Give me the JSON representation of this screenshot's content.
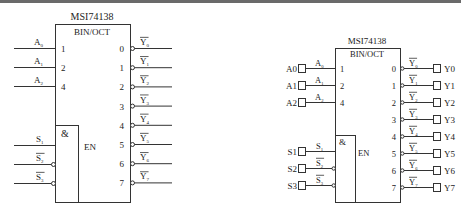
{
  "left": {
    "chip_name": "MSI74138",
    "function_label": "BIN/OCT",
    "enable_label": "EN",
    "and_label": "&",
    "inputs": [
      {
        "name": "A",
        "sub": "0",
        "pin": "1"
      },
      {
        "name": "A",
        "sub": "1",
        "pin": "2"
      },
      {
        "name": "A",
        "sub": "2",
        "pin": "4"
      }
    ],
    "enables": [
      {
        "name": "S",
        "sub": "1",
        "inverted": false
      },
      {
        "name": "S",
        "sub": "2",
        "inverted": true
      },
      {
        "name": "S",
        "sub": "3",
        "inverted": true
      }
    ],
    "outputs": [
      {
        "pin": "0",
        "name": "Y",
        "sub": "0"
      },
      {
        "pin": "1",
        "name": "Y",
        "sub": "1"
      },
      {
        "pin": "2",
        "name": "Y",
        "sub": "2"
      },
      {
        "pin": "3",
        "name": "Y",
        "sub": "3"
      },
      {
        "pin": "4",
        "name": "Y",
        "sub": "4"
      },
      {
        "pin": "5",
        "name": "Y",
        "sub": "5"
      },
      {
        "pin": "6",
        "name": "Y",
        "sub": "6"
      },
      {
        "pin": "7",
        "name": "Y",
        "sub": "7"
      }
    ]
  },
  "right": {
    "chip_name": "MSI74138",
    "function_label": "BIN/OCT",
    "enable_label": "EN",
    "and_label": "&",
    "inputs": [
      {
        "port": "A0",
        "name": "A",
        "sub": "0",
        "pin": "1"
      },
      {
        "port": "A1",
        "name": "A",
        "sub": "1",
        "pin": "2"
      },
      {
        "port": "A2",
        "name": "A",
        "sub": "2",
        "pin": "4"
      }
    ],
    "enables": [
      {
        "port": "S1",
        "name": "S",
        "sub": "1",
        "inverted": false
      },
      {
        "port": "S2",
        "name": "S",
        "sub": "2",
        "inverted": true
      },
      {
        "port": "S3",
        "name": "S",
        "sub": "3",
        "inverted": true
      }
    ],
    "outputs": [
      {
        "pin": "0",
        "name": "Y",
        "sub": "0",
        "port": "Y0"
      },
      {
        "pin": "1",
        "name": "Y",
        "sub": "1",
        "port": "Y1"
      },
      {
        "pin": "2",
        "name": "Y",
        "sub": "2",
        "port": "Y2"
      },
      {
        "pin": "3",
        "name": "Y",
        "sub": "3",
        "port": "Y3"
      },
      {
        "pin": "4",
        "name": "Y",
        "sub": "4",
        "port": "Y4"
      },
      {
        "pin": "5",
        "name": "Y",
        "sub": "5",
        "port": "Y5"
      },
      {
        "pin": "6",
        "name": "Y",
        "sub": "6",
        "port": "Y6"
      },
      {
        "pin": "7",
        "name": "Y",
        "sub": "7",
        "port": "Y7"
      }
    ]
  }
}
